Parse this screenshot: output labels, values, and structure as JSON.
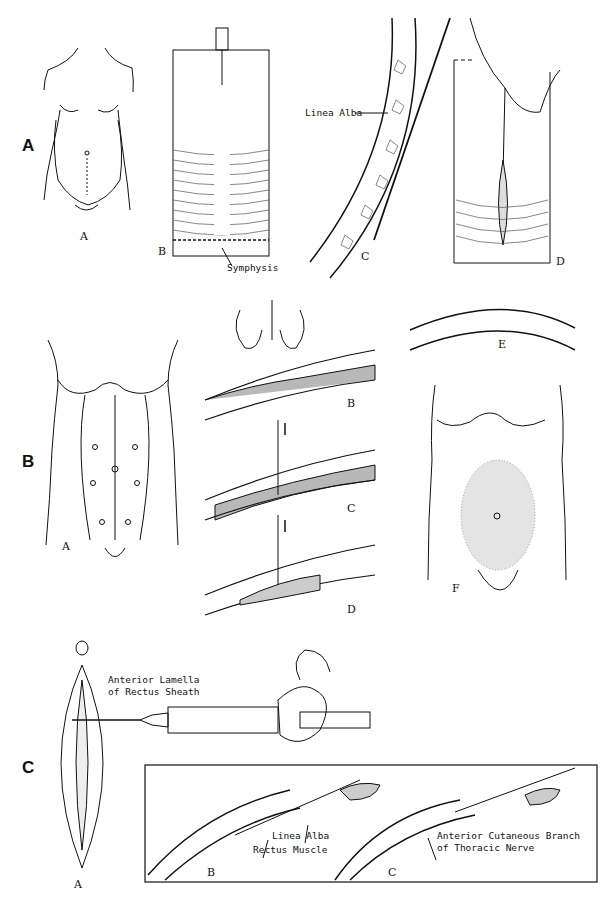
{
  "figure": {
    "panels": [
      {
        "letter": "A",
        "subfigures": [
          {
            "label": "A",
            "description": "pregnant abdomen, front view, dotted midline below umbilicus"
          },
          {
            "label": "B",
            "description": "abdominal wall with needle at top, midline infiltration",
            "callouts": [
              "Symphysis"
            ]
          },
          {
            "label": "C",
            "description": "cross-section of abdominal wall with needle along linea alba",
            "callouts": [
              "Linea Alba"
            ]
          },
          {
            "label": "D",
            "description": "fingers lifting skin, needle along midline, elliptical incision"
          }
        ]
      },
      {
        "letter": "B",
        "subfigures": [
          {
            "label": "A",
            "description": "torso with rectus muscles and injection points"
          },
          {
            "label": "B",
            "description": "fingers pinching skin, needle entering"
          },
          {
            "label": "C",
            "description": "needle advanced downward through layers"
          },
          {
            "label": "D",
            "description": "needle withdrawn upward, infiltrated area"
          },
          {
            "label": "E",
            "description": "curved abdominal wall cross-section"
          },
          {
            "label": "F",
            "description": "torso with stippled infiltration area around umbilicus"
          }
        ]
      },
      {
        "letter": "C",
        "subfigures": [
          {
            "label": "A",
            "description": "elliptical incision with syringe injecting",
            "callouts": [
              "Anterior Lamella",
              "of Rectus Sheath"
            ]
          },
          {
            "label": "B",
            "description": "needle inserted beneath rectus sheath",
            "callouts": [
              "Linea Alba",
              "Rectus Muscle"
            ]
          },
          {
            "label": "C",
            "description": "needle advanced along nerve",
            "callouts": [
              "Anterior Cutaneous Branch",
              "of Thoracic Nerve"
            ]
          }
        ]
      }
    ]
  },
  "labels": {
    "panelA": "A",
    "panelB": "B",
    "panelC": "C",
    "a_sub_A": "A",
    "a_sub_B": "B",
    "a_sub_C": "C",
    "a_sub_D": "D",
    "symphysis": "Symphysis",
    "linea_alba_top": "Linea Alba",
    "b_sub_A": "A",
    "b_sub_B": "B",
    "b_sub_C": "C",
    "b_sub_D": "D",
    "b_sub_E": "E",
    "b_sub_F": "F",
    "c_sub_A": "A",
    "c_sub_B": "B",
    "c_sub_C": "C",
    "ant_lamella_1": "Anterior Lamella",
    "ant_lamella_2": "of Rectus Sheath",
    "linea_alba_bottom": "Linea Alba",
    "rectus_muscle": "Rectus Muscle",
    "nerve_1": "Anterior Cutaneous Branch",
    "nerve_2": "of Thoracic Nerve"
  }
}
